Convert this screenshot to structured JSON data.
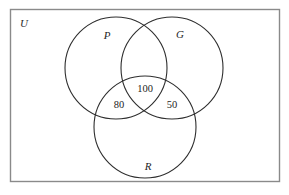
{
  "diagram": {
    "type": "venn-diagram",
    "sets_count": 3,
    "universe": {
      "label": "U",
      "shape": "rectangle",
      "stroke_color": "#8a8a8a"
    },
    "circles": [
      {
        "id": "P",
        "label": "P",
        "cx": 116,
        "cy": 68,
        "r": 51,
        "stroke_color": "#2e2e2e"
      },
      {
        "id": "G",
        "label": "G",
        "cx": 172,
        "cy": 68,
        "r": 51,
        "stroke_color": "#2e2e2e"
      },
      {
        "id": "R",
        "label": "R",
        "cx": 145,
        "cy": 127,
        "r": 51,
        "stroke_color": "#2e2e2e"
      }
    ],
    "set_labels": [
      {
        "id": "P",
        "text": "P",
        "x": 107,
        "y": 39
      },
      {
        "id": "G",
        "text": "G",
        "x": 180,
        "y": 38
      },
      {
        "id": "R",
        "text": "R",
        "x": 148,
        "y": 170
      }
    ],
    "region_values": [
      {
        "id": "P-G-R",
        "text": "100",
        "x": 145,
        "y": 92
      },
      {
        "id": "P-R",
        "text": "80",
        "x": 119,
        "y": 108
      },
      {
        "id": "G-R",
        "text": "50",
        "x": 172,
        "y": 108
      }
    ],
    "background_color": "#ffffff"
  }
}
